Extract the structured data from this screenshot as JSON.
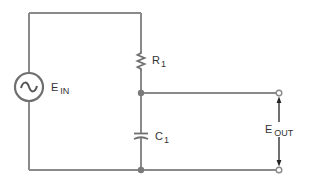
{
  "diagram": {
    "type": "rc-low-pass-circuit",
    "colors": {
      "wire": "#8a8a8a",
      "component": "#6f6f6f",
      "text": "#333333",
      "arrow": "#222222",
      "background": "#ffffff"
    },
    "labels": {
      "source": {
        "main": "E",
        "sub": "IN"
      },
      "resistor": {
        "main": "R",
        "sub": "1"
      },
      "capacitor": {
        "main": "C",
        "sub": "1"
      },
      "output": {
        "main": "E",
        "sub": "OUT"
      }
    },
    "components": [
      {
        "id": "ein",
        "kind": "ac-voltage-source",
        "label": "E IN"
      },
      {
        "id": "r1",
        "kind": "resistor",
        "label": "R1"
      },
      {
        "id": "c1",
        "kind": "capacitor",
        "label": "C1"
      },
      {
        "id": "eout",
        "kind": "output-terminals",
        "label": "E OUT"
      }
    ],
    "connections": [
      [
        "ein.top",
        "r1.top"
      ],
      [
        "r1.bottom",
        "node_mid"
      ],
      [
        "node_mid",
        "c1.top"
      ],
      [
        "node_mid",
        "eout.top"
      ],
      [
        "c1.bottom",
        "node_bottom"
      ],
      [
        "node_bottom",
        "ein.bottom"
      ],
      [
        "node_bottom",
        "eout.bottom"
      ]
    ]
  }
}
